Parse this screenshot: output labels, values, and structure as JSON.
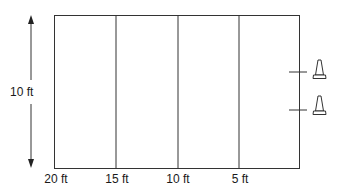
{
  "diagram": {
    "width_label": "10 ft",
    "x_labels": [
      "20 ft",
      "15 ft",
      "10 ft",
      "5 ft"
    ],
    "cones": [
      {
        "name": "cone-1"
      },
      {
        "name": "cone-2"
      }
    ],
    "colors": {
      "line": "#333333",
      "background": "#ffffff"
    }
  }
}
